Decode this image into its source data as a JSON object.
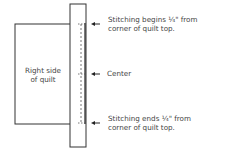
{
  "diagram": {
    "labels": {
      "quilt_line1": "Right side",
      "quilt_line2": "of quilt",
      "top_line1": "Stitching begins ¼\" from",
      "top_line2": "corner of quilt top.",
      "center": "Center",
      "bottom_line1": "Stitching ends ¼\" from",
      "bottom_line2": "corner of quilt top."
    },
    "colors": {
      "stroke": "#333333",
      "background": "#ffffff"
    }
  }
}
